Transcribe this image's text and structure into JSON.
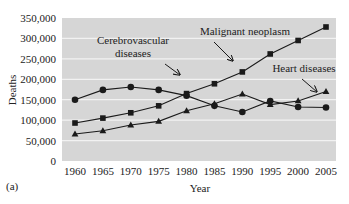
{
  "panel_label": "(a)",
  "chart_data": {
    "type": "line",
    "title": "",
    "xlabel": "Year",
    "ylabel": "Deaths",
    "ylim": [
      0,
      350000
    ],
    "grid": "horizontal",
    "legend_position": "annotations",
    "x": [
      1960,
      1965,
      1970,
      1975,
      1980,
      1985,
      1990,
      1995,
      2000,
      2005
    ],
    "x_tick_labels": [
      "1960",
      "1965",
      "1970",
      "1975",
      "1980",
      "1985",
      "1990",
      "1995",
      "2000",
      "2005"
    ],
    "y_ticks": [
      0,
      50000,
      100000,
      150000,
      200000,
      250000,
      300000,
      350000
    ],
    "y_tick_labels": [
      "0",
      "50,000",
      "100,000",
      "150,000",
      "200,000",
      "250,000",
      "300,000",
      "350,000"
    ],
    "series": [
      {
        "name": "Cerebrovascular diseases",
        "marker": "circle",
        "values": [
          150000,
          174000,
          181000,
          174000,
          160000,
          135000,
          120000,
          147000,
          132000,
          131000
        ]
      },
      {
        "name": "Malignant neoplasm",
        "marker": "square",
        "values": [
          93000,
          105000,
          118000,
          135000,
          165000,
          189000,
          218000,
          262000,
          295000,
          328000
        ]
      },
      {
        "name": "Heart diseases",
        "marker": "triangle",
        "values": [
          66000,
          74000,
          88000,
          97000,
          123000,
          140000,
          164000,
          138000,
          147000,
          170000
        ]
      }
    ],
    "annotations": [
      {
        "text": [
          "Cerebrovascular",
          "diseases"
        ],
        "text_x": 133,
        "text_y": [
          44,
          57
        ],
        "arrow_from": [
          165,
          64
        ],
        "arrow_to": [
          180,
          75
        ]
      },
      {
        "text": [
          "Malignant neoplasm"
        ],
        "text_x": 245,
        "text_y": [
          35
        ],
        "arrow_from": [
          214,
          42
        ],
        "arrow_to": [
          233,
          61
        ]
      },
      {
        "text": [
          "Heart diseases"
        ],
        "text_x": 304,
        "text_y": [
          72
        ],
        "arrow_from": [
          302,
          79
        ],
        "arrow_to": [
          317,
          92
        ]
      }
    ]
  },
  "style": {
    "plot_bg": "#d6d6d6",
    "grid_color": "#f2f2f2",
    "line_color": "#1a1a1a"
  }
}
